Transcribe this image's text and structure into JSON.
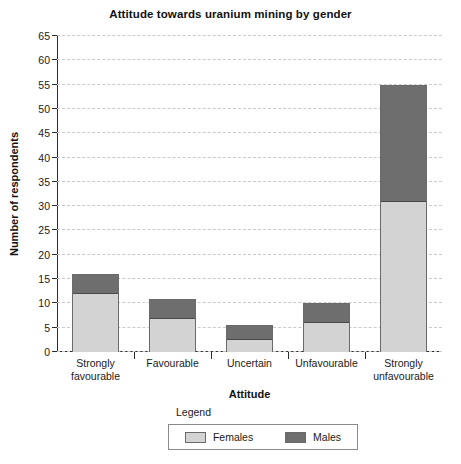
{
  "chart_data": {
    "type": "bar",
    "title": "Attitude towards uranium mining by gender",
    "xlabel": "Attitude",
    "ylabel": "Number of respondents",
    "categories": [
      "Strongly favourable",
      "Favourable",
      "Uncertain",
      "Unfavourable",
      "Strongly unfavourable"
    ],
    "category_lines": [
      [
        "Strongly",
        "favourable"
      ],
      [
        "Favourable"
      ],
      [
        "Uncertain"
      ],
      [
        "Unfavourable"
      ],
      [
        "Strongly",
        "unfavourable"
      ]
    ],
    "stacked": true,
    "series": [
      {
        "name": "Females",
        "color": "#d3d3d3",
        "values": [
          12,
          7,
          2.5,
          6,
          31
        ]
      },
      {
        "name": "Males",
        "color": "#6e6e6e",
        "values": [
          4,
          4,
          3,
          4,
          24
        ]
      }
    ],
    "totals": [
      16,
      11,
      5.5,
      10,
      55
    ],
    "ylim": [
      0,
      65
    ],
    "ytick_step": 5,
    "yticks": [
      0,
      5,
      10,
      15,
      20,
      25,
      30,
      35,
      40,
      45,
      50,
      55,
      60,
      65
    ],
    "grid": true,
    "legend_position": "bottom",
    "legend_title": "Legend"
  },
  "legend": {
    "title": "Legend",
    "items": [
      {
        "label": "Females",
        "swatch": "females-swatch"
      },
      {
        "label": "Males",
        "swatch": "males-swatch"
      }
    ]
  },
  "colors": {
    "females": "#d3d3d3",
    "males": "#6e6e6e",
    "axis": "#2b2b2b",
    "grid": "#c9c9d2"
  }
}
